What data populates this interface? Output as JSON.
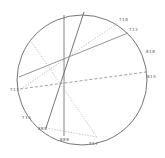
{
  "diagram": {
    "type": "stereonet",
    "circle": {
      "cx": 82,
      "cy": 80,
      "r": 65,
      "stroke": "#666666"
    },
    "lines": [
      {
        "id": "l1",
        "x1": 64,
        "y1": 15,
        "x2": 64,
        "y2": 136,
        "style": "solid",
        "color": "#777777"
      },
      {
        "id": "l2",
        "x1": 84,
        "y1": 12,
        "x2": 46,
        "y2": 128,
        "style": "solid",
        "color": "#666666"
      },
      {
        "id": "l3",
        "x1": 19,
        "y1": 77,
        "x2": 128,
        "y2": 33,
        "style": "solid",
        "color": "#888888"
      },
      {
        "id": "l4",
        "x1": 20,
        "y1": 89,
        "x2": 146,
        "y2": 72,
        "style": "dashed",
        "color": "#888888"
      },
      {
        "id": "l5",
        "x1": 21,
        "y1": 89,
        "x2": 118,
        "y2": 23,
        "style": "dotted",
        "color": "#aaaaaa"
      },
      {
        "id": "l6",
        "x1": 30,
        "y1": 40,
        "x2": 97,
        "y2": 137,
        "style": "dotted",
        "color": "#aaaaaa"
      },
      {
        "id": "l7",
        "x1": 46,
        "y1": 128,
        "x2": 97,
        "y2": 137,
        "style": "dotted",
        "color": "#aaaaaa"
      }
    ],
    "labels": [
      {
        "text": "T10",
        "x": 119,
        "y": 21
      },
      {
        "text": "T12",
        "x": 129,
        "y": 31
      },
      {
        "text": "818",
        "x": 146,
        "y": 53
      },
      {
        "text": "815",
        "x": 147,
        "y": 78
      },
      {
        "text": "T11",
        "x": 10,
        "y": 91
      },
      {
        "text": "T13",
        "x": 22,
        "y": 119
      },
      {
        "text": "888",
        "x": 38,
        "y": 130
      },
      {
        "text": "888",
        "x": 60,
        "y": 141
      },
      {
        "text": "T17",
        "x": 89,
        "y": 145
      }
    ]
  }
}
